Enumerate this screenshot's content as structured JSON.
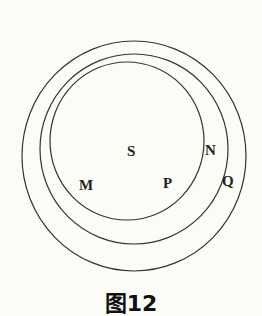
{
  "diagram": {
    "type": "nested-circles (Venn / set inclusion)",
    "stroke_color": "#333333",
    "background": "#fcfcf6",
    "circles": [
      {
        "id": "Q",
        "role": "outer",
        "cx": 134,
        "cy": 156,
        "rx": 112,
        "ry": 115
      },
      {
        "id": "N",
        "role": "middle",
        "cx": 134,
        "cy": 149,
        "rx": 94,
        "ry": 95
      },
      {
        "id": "P",
        "role": "inner",
        "cx": 127,
        "cy": 141,
        "rx": 77,
        "ry": 79
      }
    ],
    "labels": {
      "S": "S",
      "M": "M",
      "P": "P",
      "N": "N",
      "Q": "Q"
    },
    "caption": "图12"
  }
}
